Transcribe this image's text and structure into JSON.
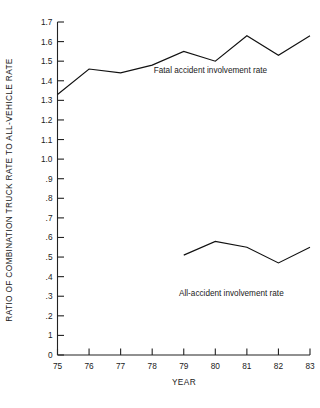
{
  "chart_data": {
    "type": "line",
    "title": "",
    "xlabel": "YEAR",
    "ylabel": "RATIO OF COMBINATION TRUCK RATE TO ALL-VEHICLE RATE",
    "x": [
      75,
      76,
      77,
      78,
      79,
      80,
      81,
      82,
      83
    ],
    "xtick_labels": [
      "75",
      "76",
      "77",
      "78",
      "79",
      "80",
      "81",
      "82",
      "83"
    ],
    "ytick_labels": [
      "1.7",
      "1.6",
      "1.5",
      "1.4",
      "1.3",
      "1.2",
      "1.1",
      "1.0",
      ".9",
      ".8",
      ".7",
      ".6",
      ".5",
      ".4",
      ".3",
      ".2",
      "1",
      "0"
    ],
    "ytick_values": [
      1.7,
      1.6,
      1.5,
      1.4,
      1.3,
      1.2,
      1.1,
      1.0,
      0.9,
      0.8,
      0.7,
      0.6,
      0.5,
      0.4,
      0.3,
      0.2,
      0.1,
      0.0
    ],
    "ylim": [
      0,
      1.7
    ],
    "xlim": [
      75,
      83
    ],
    "grid": false,
    "legend_position": "inline-annotation",
    "series": [
      {
        "name": "Fatal accident involvement rate",
        "x": [
          75,
          76,
          77,
          78,
          79,
          80,
          81,
          82,
          83
        ],
        "values": [
          1.33,
          1.46,
          1.44,
          1.48,
          1.55,
          1.5,
          1.63,
          1.53,
          1.63
        ]
      },
      {
        "name": "All-accident involvement rate",
        "x": [
          79,
          80,
          81,
          82,
          83
        ],
        "values": [
          0.51,
          0.58,
          0.55,
          0.47,
          0.55
        ]
      }
    ],
    "annotations": [
      {
        "text": "Fatal accident involvement rate",
        "x": 78.05,
        "y": 1.44
      },
      {
        "text": "All-accident involvement rate",
        "x": 78.85,
        "y": 0.3
      }
    ]
  },
  "colors": {
    "line": "#111111",
    "axis": "#222222",
    "text": "#1a1a1a",
    "background": "#ffffff"
  }
}
